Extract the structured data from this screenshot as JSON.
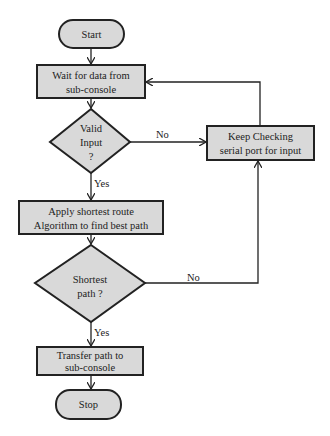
{
  "diagram": {
    "type": "flowchart",
    "colors": {
      "fill": "#d9d9d9",
      "stroke": "#222222",
      "background": "#ffffff"
    },
    "nodes": {
      "start": {
        "shape": "terminal",
        "label": "Start"
      },
      "wait": {
        "shape": "process",
        "line1": "Wait for data from",
        "line2": "sub-console"
      },
      "valid": {
        "shape": "decision",
        "line1": "Valid",
        "line2": "Input",
        "line3": "?"
      },
      "check": {
        "shape": "process",
        "line1": "Keep Checking",
        "line2": "serial port for input"
      },
      "apply": {
        "shape": "process",
        "line1": "Apply shortest route",
        "line2": "Algorithm to find best path"
      },
      "shortest": {
        "shape": "decision",
        "line1": "Shortest",
        "line2": "path ?"
      },
      "transfer": {
        "shape": "process",
        "line1": "Transfer path to",
        "line2": "sub-console"
      },
      "stop": {
        "shape": "terminal",
        "label": "Stop"
      }
    },
    "edges": {
      "valid_no": "No",
      "valid_yes": "Yes",
      "shortest_no": "No",
      "shortest_yes": "Yes"
    }
  }
}
